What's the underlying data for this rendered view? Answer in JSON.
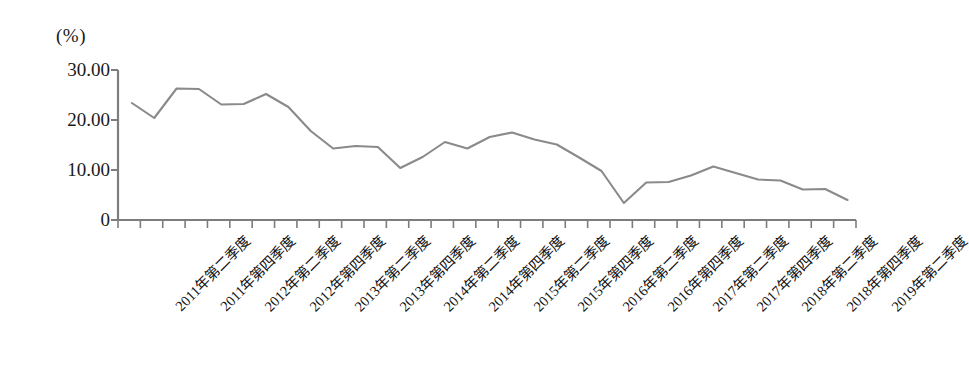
{
  "chart_data": {
    "type": "line",
    "title": "",
    "subtitle": "",
    "unit_label": "(%)",
    "xlabel": "",
    "ylabel": "",
    "ylim": [
      0,
      30
    ],
    "y_ticks": [
      "0",
      "10.00",
      "20.00",
      "30.00"
    ],
    "y_tick_values": [
      0,
      10,
      20,
      30
    ],
    "grid": false,
    "legend": "none",
    "line_color": "#8a8a8a",
    "axis_color": "#7d7d7d",
    "x_tick_count": 33,
    "x_labels_every": 2,
    "categories": [
      "2011年第二季度",
      "2011年第三季度",
      "2011年第四季度",
      "2012年第一季度",
      "2012年第二季度",
      "2012年第三季度",
      "2012年第四季度",
      "2013年第一季度",
      "2013年第二季度",
      "2013年第三季度",
      "2013年第四季度",
      "2014年第一季度",
      "2014年第二季度",
      "2014年第三季度",
      "2014年第四季度",
      "2015年第一季度",
      "2015年第二季度",
      "2015年第三季度",
      "2015年第四季度",
      "2016年第一季度",
      "2016年第二季度",
      "2016年第三季度",
      "2016年第四季度",
      "2017年第一季度",
      "2017年第二季度",
      "2017年第三季度",
      "2017年第四季度",
      "2018年第一季度",
      "2018年第二季度",
      "2018年第三季度",
      "2018年第四季度",
      "2019年第一季度",
      "2019年第二季度"
    ],
    "visible_tick_labels": [
      "2011年第二季度",
      "2011年第四季度",
      "2012年第二季度",
      "2012年第四季度",
      "2013年第二季度",
      "2013年第四季度",
      "2014年第二季度",
      "2014年第四季度",
      "2015年第二季度",
      "2015年第四季度",
      "2016年第二季度",
      "2016年第四季度",
      "2017年第二季度",
      "2017年第四季度",
      "2018年第二季度",
      "2018年第四季度",
      "2019年第二季度"
    ],
    "values": [
      23.4,
      20.4,
      26.3,
      26.2,
      23.1,
      23.2,
      25.2,
      22.6,
      17.8,
      14.3,
      14.8,
      14.6,
      10.4,
      12.6,
      15.6,
      14.3,
      16.6,
      17.5,
      16.1,
      15.1,
      12.5,
      9.8,
      3.4,
      7.5,
      7.6,
      8.9,
      10.7,
      9.4,
      8.1,
      7.9,
      6.1,
      6.2,
      4.0
    ]
  }
}
